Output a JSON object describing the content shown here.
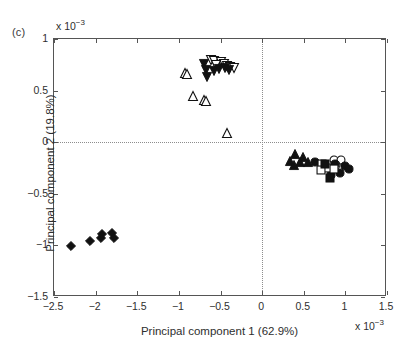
{
  "panel": {
    "label": "(c)"
  },
  "axes": {
    "x": {
      "title": "Principal component 1 (62.9%)",
      "multiplier_prefix": "x 10",
      "multiplier_exponent": "−3",
      "min": -2.5,
      "max": 1.5,
      "ticks": [
        -2.5,
        -2,
        -1.5,
        -1,
        -0.5,
        0,
        0.5,
        1,
        1.5
      ],
      "tick_labels": [
        "−2.5",
        "−2",
        "−1.5",
        "−1",
        "−0.5",
        "0",
        "0.5",
        "1",
        "1.5"
      ]
    },
    "y": {
      "title": "Principal component 2 (19.8%)",
      "multiplier_prefix": "x 10",
      "multiplier_exponent": "−3",
      "min": -1.5,
      "max": 1,
      "ticks": [
        -1.5,
        -1,
        -0.5,
        0,
        0.5,
        1
      ],
      "tick_labels": [
        "−1.5",
        "−1",
        "−0.5",
        "0",
        "0.5",
        "1"
      ]
    },
    "reference_lines": {
      "horizontal_at": 0,
      "vertical_at": 0,
      "style": "dotted",
      "color": "#8d8d8d"
    },
    "frame_color": "#555555"
  },
  "chart_data": {
    "type": "scatter",
    "title": "",
    "xlabel": "Principal component 1 (62.9%)",
    "ylabel": "Principal component 2 (19.8%)",
    "xlim": [
      -2.5,
      1.5
    ],
    "ylim": [
      -1.5,
      1.0
    ],
    "x_scale_factor": 0.001,
    "y_scale_factor": 0.001,
    "grid": false,
    "legend": "none",
    "marker_color": "#111111",
    "series": [
      {
        "name": "open-down-triangle",
        "marker": "triangle-down",
        "fill": "open",
        "points": [
          [
            -0.62,
            0.8
          ],
          [
            -0.58,
            0.79
          ],
          [
            -0.5,
            0.78
          ],
          [
            -0.46,
            0.76
          ],
          [
            -0.42,
            0.74
          ],
          [
            -0.38,
            0.73
          ],
          [
            -0.34,
            0.72
          ],
          [
            -0.55,
            0.75
          ]
        ]
      },
      {
        "name": "filled-down-triangle",
        "marker": "triangle-down",
        "fill": "filled",
        "points": [
          [
            -0.7,
            0.76
          ],
          [
            -0.68,
            0.7
          ],
          [
            -0.58,
            0.69
          ],
          [
            -0.52,
            0.71
          ],
          [
            -0.44,
            0.72
          ],
          [
            -0.4,
            0.7
          ],
          [
            -0.66,
            0.63
          ]
        ]
      },
      {
        "name": "open-up-triangle",
        "marker": "triangle-up",
        "fill": "open",
        "points": [
          [
            -0.93,
            0.67
          ],
          [
            -0.9,
            0.66
          ],
          [
            -0.83,
            0.45
          ],
          [
            -0.7,
            0.41
          ],
          [
            -0.68,
            0.4
          ],
          [
            -0.42,
            0.09
          ]
        ]
      },
      {
        "name": "filled-up-triangle",
        "marker": "triangle-up",
        "fill": "filled",
        "points": [
          [
            0.4,
            -0.11
          ],
          [
            0.49,
            -0.14
          ],
          [
            0.33,
            -0.18
          ],
          [
            0.45,
            -0.19
          ],
          [
            0.38,
            -0.22
          ],
          [
            0.55,
            -0.19
          ]
        ]
      },
      {
        "name": "open-circle",
        "marker": "circle",
        "fill": "open",
        "points": [
          [
            0.86,
            -0.17
          ],
          [
            0.95,
            -0.17
          ],
          [
            0.89,
            -0.22
          ]
        ]
      },
      {
        "name": "filled-circle",
        "marker": "circle",
        "fill": "filled",
        "points": [
          [
            0.63,
            -0.19
          ],
          [
            0.88,
            -0.21
          ],
          [
            0.99,
            -0.23
          ],
          [
            1.04,
            -0.26
          ],
          [
            0.93,
            -0.3
          ],
          [
            0.83,
            -0.32
          ]
        ]
      },
      {
        "name": "open-square",
        "marker": "square",
        "fill": "open",
        "points": [
          [
            0.72,
            -0.21
          ],
          [
            0.78,
            -0.25
          ],
          [
            0.71,
            -0.27
          ],
          [
            0.86,
            -0.26
          ]
        ]
      },
      {
        "name": "filled-square",
        "marker": "square",
        "fill": "filled",
        "points": [
          [
            0.76,
            -0.21
          ],
          [
            0.81,
            -0.35
          ]
        ]
      },
      {
        "name": "filled-diamond",
        "marker": "diamond",
        "fill": "filled",
        "points": [
          [
            -2.3,
            -1.01
          ],
          [
            -2.07,
            -0.96
          ],
          [
            -1.93,
            -0.93
          ],
          [
            -1.92,
            -0.89
          ],
          [
            -1.8,
            -0.88
          ],
          [
            -1.78,
            -0.93
          ]
        ]
      }
    ]
  }
}
